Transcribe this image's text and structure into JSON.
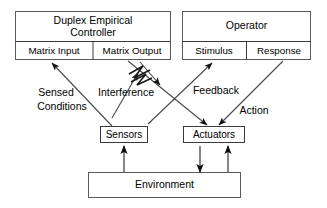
{
  "diagram": {
    "colors": {
      "background": "#ffffff",
      "box_stroke": "#5a5a5a",
      "inner_stroke": "#3a3a3a",
      "line": "#4a4a4a",
      "arrow": "#111111",
      "text": "#000000"
    },
    "boxes": {
      "controller": {
        "title_line1": "Duplex Empirical",
        "title_line2": "Controller",
        "cell_left": "Matrix Input",
        "cell_right": "Matrix Output"
      },
      "operator": {
        "title": "Operator",
        "cell_left": "Stimulus",
        "cell_right": "Response"
      },
      "sensors": {
        "label": "Sensors"
      },
      "actuators": {
        "label": "Actuators"
      },
      "environment": {
        "label": "Environment"
      }
    },
    "edge_labels": {
      "sensed_line1": "Sensed",
      "sensed_line2": "Conditions",
      "interference": "Interference",
      "feedback": "Feedback",
      "action": "Action"
    },
    "symbols": {
      "interference_symbol": "zigzag-lightning-icon"
    }
  }
}
